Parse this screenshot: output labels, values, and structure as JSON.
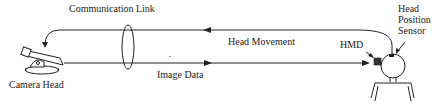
{
  "diagram": {
    "labels": {
      "communication_link": "Communication Link",
      "head_movement": "Head Movement",
      "image_data": "Image Data",
      "camera_head": "Camera Head",
      "hmd": "HMD",
      "sensor_line1": "Head",
      "sensor_line2": "Position",
      "sensor_line3": "Sensor"
    },
    "colors": {
      "line": "#222222",
      "background": "#ffffff"
    }
  }
}
